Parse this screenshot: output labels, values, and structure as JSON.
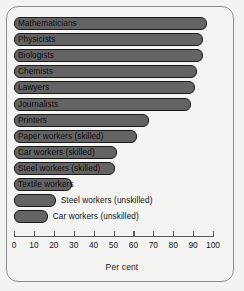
{
  "chart_data": {
    "type": "bar",
    "orientation": "horizontal",
    "title": "",
    "xlabel": "Per cent",
    "ylabel": "",
    "xlim": [
      0,
      100
    ],
    "grid": false,
    "legend": "none",
    "tick_labels": [
      "0",
      "10",
      "20",
      "30",
      "40",
      "50",
      "60",
      "70",
      "80",
      "90",
      "100"
    ],
    "tick_values": [
      0,
      10,
      20,
      30,
      40,
      50,
      60,
      70,
      80,
      90,
      100
    ],
    "categories": [
      "Mathematicians",
      "Physicists",
      "Biologists",
      "Chemists",
      "Lawyers",
      "Journalists",
      "Printers",
      "Paper workers (skilled)",
      "Car workers (skilled)",
      "Steel workers (skilled)",
      "Textile workers",
      "Steel workers (unskilled)",
      "Car workers (unskilled)"
    ],
    "values": [
      97,
      95,
      95,
      92,
      91,
      89,
      68,
      62,
      52,
      51,
      29,
      21,
      17
    ],
    "label_placement": [
      "inside",
      "inside",
      "inside",
      "inside",
      "inside",
      "inside",
      "inside",
      "inside",
      "inside",
      "inside",
      "inside",
      "outside",
      "outside"
    ],
    "colors": {
      "bar_fill": "#636363",
      "bar_stroke": "#1c1c1c",
      "panel_background": "#f4f4f2",
      "page_background": "#f2f2f0",
      "frame_border": "#8a8a8a",
      "axis": "#5a5a5a",
      "text": "#111111"
    }
  }
}
